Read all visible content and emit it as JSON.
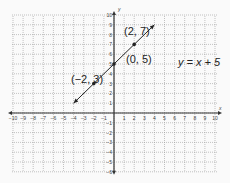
{
  "chart_data": {
    "type": "line",
    "title": "",
    "xlabel": "x",
    "ylabel": "y",
    "xlim": [
      -10,
      10
    ],
    "ylim": [
      -6,
      10
    ],
    "grid": true,
    "x_ticks": [
      -10,
      -9,
      -8,
      -7,
      -6,
      -5,
      -4,
      -3,
      -2,
      -1,
      1,
      2,
      3,
      4,
      5,
      6,
      7,
      8,
      9,
      10
    ],
    "y_ticks": [
      -6,
      -5,
      -4,
      -3,
      -2,
      -1,
      1,
      2,
      3,
      4,
      5,
      6,
      7,
      8,
      9,
      10
    ],
    "series": [
      {
        "name": "y = x + 5",
        "equation": "y = x + 5",
        "slope": 1,
        "intercept": 5,
        "x_range": [
          -4,
          4
        ],
        "points": [
          {
            "x": -2,
            "y": 3,
            "label": "(−2, 3)"
          },
          {
            "x": 0,
            "y": 5,
            "label": "(0, 5)"
          },
          {
            "x": 2,
            "y": 7,
            "label": "(2, 7)"
          }
        ]
      }
    ],
    "annotations": [
      {
        "text": "y = x + 5",
        "x": 6.5,
        "y": 5.8
      },
      {
        "text": "(2, 7)",
        "x": 1,
        "y": 8.1
      },
      {
        "text": "(0, 5)",
        "x": 1.2,
        "y": 4.1
      },
      {
        "text": "(−2, 3)",
        "x": -5.6,
        "y": 3.4
      }
    ]
  },
  "labels": {
    "equation": "y = x + 5",
    "p1": "(2, 7)",
    "p2": "(0, 5)",
    "p3": "(−2, 3)",
    "x_axis": "x",
    "y_axis": "y"
  }
}
